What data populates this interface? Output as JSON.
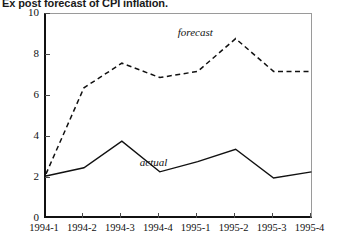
{
  "figure": {
    "title": "Ex post forecast of CPI inflation."
  },
  "chart_data": {
    "type": "line",
    "title": "Ex post forecast of CPI inflation.",
    "xlabel": "",
    "ylabel": "INFL, annualized rate of growth",
    "categories": [
      "1994-1",
      "1994-2",
      "1994-3",
      "1994-4",
      "1995-1",
      "1995-2",
      "1995-3",
      "1995-4"
    ],
    "ylim": [
      0,
      10
    ],
    "yticks": [
      0,
      2,
      4,
      6,
      8,
      10
    ],
    "grid": false,
    "legend_position": "inline-annotation",
    "series": [
      {
        "name": "forecast",
        "style": "dashed",
        "color": "#111111",
        "values": [
          2.2,
          6.4,
          7.6,
          6.9,
          7.2,
          8.8,
          7.2,
          7.2
        ]
      },
      {
        "name": "actual",
        "style": "solid",
        "color": "#111111",
        "values": [
          2.1,
          2.5,
          3.8,
          2.3,
          2.8,
          3.4,
          2.0,
          2.3
        ]
      }
    ],
    "annotations": [
      {
        "text": "forecast",
        "x": "1995-1",
        "y": 9.0
      },
      {
        "text": "actual",
        "x": "1994-4",
        "y": 2.65
      }
    ]
  }
}
